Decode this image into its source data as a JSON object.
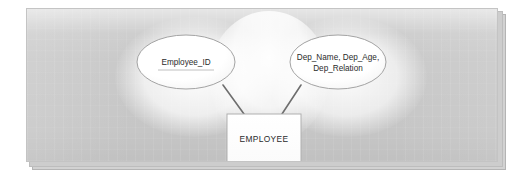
{
  "diagram": {
    "type": "er-diagram",
    "title": "",
    "entity": {
      "name": "EMPLOYEE",
      "shape": "rectangle"
    },
    "attributes": [
      {
        "id": "employee-id",
        "shape": "ellipse",
        "key": true,
        "lines": [
          "Employee_ID"
        ]
      },
      {
        "id": "dependent-composite",
        "shape": "ellipse",
        "key": false,
        "lines": [
          "Dep_Name, Dep_Age,",
          "Dep_Relation"
        ]
      }
    ],
    "connectors": [
      {
        "id": "employee-id-to-entity",
        "from": "employee-id",
        "to": "employee-entity"
      },
      {
        "id": "dependent-to-entity",
        "from": "dependent-composite",
        "to": "employee-entity"
      }
    ],
    "colors": {
      "background": "#c9c9c9",
      "shape_fill": "#ffffff",
      "shape_stroke": "#9a9a9a",
      "connector": "#6e6e6e",
      "text": "#2b2b2b",
      "page": "#ffffff"
    }
  }
}
